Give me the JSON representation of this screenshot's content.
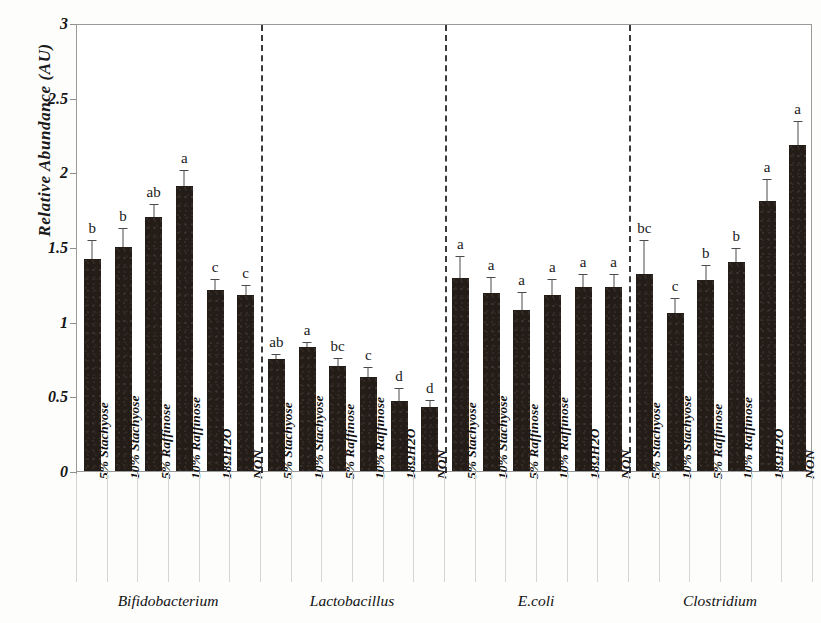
{
  "chart": {
    "type": "bar",
    "title": "",
    "ylabel": "Relative Abundance (AU)",
    "xlabel": "",
    "ylim": [
      0,
      3
    ],
    "ytick_labels": [
      "0",
      "0.5",
      "1",
      "1.5",
      "2",
      "2.5",
      "3"
    ],
    "ytick_values": [
      0,
      0.5,
      1,
      1.5,
      2,
      2.5,
      3
    ],
    "grid": false,
    "legend": "none",
    "treatments": [
      "5% Stachyose",
      "10% Stachyose",
      "5% Raffinose",
      "10% Raffinose",
      "18ΩH2O",
      "NON"
    ],
    "groups": [
      {
        "name": "Bifidobacterium",
        "values": [
          1.42,
          1.5,
          1.7,
          1.91,
          1.21,
          1.18
        ],
        "errors": [
          0.12,
          0.12,
          0.08,
          0.1,
          0.07,
          0.06
        ],
        "sig_letters": [
          "b",
          "b",
          "ab",
          "a",
          "c",
          "c"
        ]
      },
      {
        "name": "Lactobacillus",
        "values": [
          0.75,
          0.83,
          0.7,
          0.63,
          0.47,
          0.43
        ],
        "errors": [
          0.03,
          0.03,
          0.05,
          0.06,
          0.08,
          0.04
        ],
        "sig_letters": [
          "ab",
          "a",
          "bc",
          "c",
          "d",
          "d"
        ]
      },
      {
        "name": "E.coli",
        "values": [
          1.29,
          1.19,
          1.08,
          1.18,
          1.23,
          1.23
        ],
        "errors": [
          0.14,
          0.1,
          0.11,
          0.1,
          0.08,
          0.08
        ],
        "sig_letters": [
          "a",
          "a",
          "a",
          "a",
          "a",
          "a"
        ]
      },
      {
        "name": "Clostridium",
        "values": [
          1.32,
          1.06,
          1.28,
          1.4,
          1.81,
          2.18
        ],
        "errors": [
          0.22,
          0.09,
          0.09,
          0.09,
          0.14,
          0.16
        ],
        "sig_letters": [
          "bc",
          "c",
          "b",
          "b",
          "a",
          "a"
        ]
      }
    ],
    "colors": {
      "bar": "#241c17",
      "axis": "#9a9a9a",
      "separator": "#3a3a3a",
      "text": "#111111",
      "background": "#ffffff"
    }
  }
}
